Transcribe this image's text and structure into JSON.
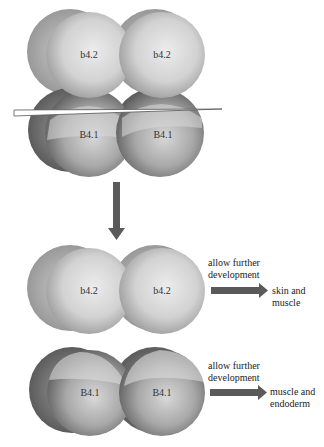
{
  "diagram": {
    "top_embryo": {
      "upper_cells": [
        "b4.2",
        "b4.2"
      ],
      "lower_cells": [
        "B4.1",
        "B4.1"
      ]
    },
    "bisection_blade": "cut",
    "stage_arrow": "down-arrow",
    "animal_pair": {
      "cells": [
        "b4.2",
        "b4.2"
      ],
      "annotation": [
        "allow further",
        "development"
      ],
      "outcome": [
        "skin and",
        "muscle"
      ]
    },
    "vegetal_pair": {
      "cells": [
        "B4.1",
        "B4.1"
      ],
      "annotation": [
        "allow further",
        "development"
      ],
      "outcome": [
        "muscle and",
        "endoderm"
      ]
    },
    "colors": {
      "arrow": "#5a5a5a",
      "cell_light": "#e6e6e6",
      "cell_mid": "#b4b4b4",
      "cell_dark": "#6a6a6a"
    }
  }
}
